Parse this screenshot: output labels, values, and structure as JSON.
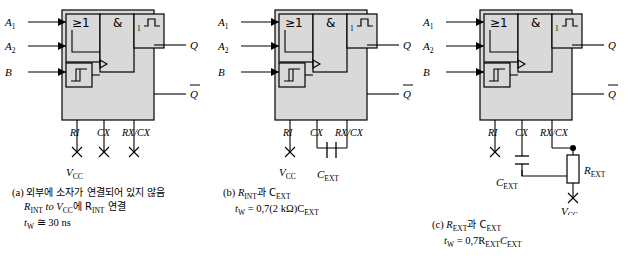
{
  "figure": {
    "panels": [
      {
        "id": "a",
        "inputs": {
          "a1": "A",
          "a1_sub": "1",
          "a2": "A",
          "a2_sub": "2",
          "b": "B"
        },
        "outputs": {
          "q": "Q",
          "qbar": "Q"
        },
        "gate_labels": {
          "or": "≥1",
          "and": "&",
          "oneshot": "1"
        },
        "pins": {
          "ri": "RI",
          "cx": "CX",
          "rxcx": "RX/CX"
        },
        "supply": "V",
        "supply_sub": "CC",
        "caption": {
          "tag": "(a)",
          "line1": "외부에 소자가 연결되어 있지 않음",
          "line2_pre": "R",
          "line2_sub": "INT",
          "line2_mid": " to V",
          "line2_sub2": "CC",
          "line2_post": "에 R",
          "line2_sub3": "INT",
          "line2_end": " 연결",
          "line3_pre": "t",
          "line3_sub": "W",
          "line3_post": " ≅ 30 ns"
        }
      },
      {
        "id": "b",
        "inputs": {
          "a1": "A",
          "a1_sub": "1",
          "a2": "A",
          "a2_sub": "2",
          "b": "B"
        },
        "outputs": {
          "q": "Q",
          "qbar": "Q"
        },
        "gate_labels": {
          "or": "≥1",
          "and": "&",
          "oneshot": "1"
        },
        "pins": {
          "ri": "RI",
          "cx": "CX",
          "rxcx": "RX/CX"
        },
        "supply": "V",
        "supply_sub": "CC",
        "components": {
          "cext": "C",
          "cext_sub": "EXT"
        },
        "caption": {
          "tag": "(b)",
          "line1_pre": "R",
          "line1_sub": "INT",
          "line1_mid": "과 C",
          "line1_sub2": "EXT",
          "line2_pre": "t",
          "line2_sub": "W",
          "line2_post": " = 0,7(2 kΩ)C",
          "line2_sub2": "EXT"
        }
      },
      {
        "id": "c",
        "inputs": {
          "a1": "A",
          "a1_sub": "1",
          "a2": "A",
          "a2_sub": "2",
          "b": "B"
        },
        "outputs": {
          "q": "Q",
          "qbar": "Q"
        },
        "gate_labels": {
          "or": "≥1",
          "and": "&",
          "oneshot": "1"
        },
        "pins": {
          "ri": "RI",
          "cx": "CX",
          "rxcx": "RX/CX"
        },
        "supply": "V",
        "supply_sub": "CC",
        "components": {
          "cext": "C",
          "cext_sub": "EXT",
          "rext": "R",
          "rext_sub": "EXT"
        },
        "caption": {
          "tag": "(c)",
          "line1_pre": "R",
          "line1_sub": "EXT",
          "line1_mid": "과 C",
          "line1_sub2": "EXT",
          "line2_pre": "t",
          "line2_sub": "W",
          "line2_post": " = 0,7R",
          "line2_sub2": "EXT",
          "line2_post2": "C",
          "line2_sub3": "EXT"
        }
      }
    ],
    "colors": {
      "box_fill": "#d9d9d9",
      "line": "#000000",
      "background": "#ffffff"
    }
  }
}
